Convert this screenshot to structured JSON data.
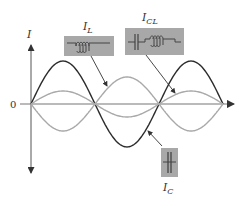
{
  "diagram": {
    "axis": {
      "y_label": "I",
      "origin_label": "0"
    },
    "labels": {
      "inductor_current": {
        "main": "I",
        "sub": "L"
      },
      "tank_current": {
        "main": "I",
        "sub": "CL"
      },
      "capacitor_current": {
        "main": "I",
        "sub": "C"
      }
    },
    "components": {
      "inductor_box": "inductor-symbol",
      "tank_box": "capacitor-inductor-symbol",
      "capacitor_box": "capacitor-symbol"
    },
    "colors": {
      "dark_curve": "#2b2b2b",
      "light_curve": "#a9a9a9",
      "axis": "#555555",
      "component_box": "#a8a8a8",
      "component_line": "#444444"
    },
    "curves": {
      "period_px": 128,
      "capacitor_amplitude": 43,
      "inductor_amplitude": 27,
      "tank_amplitude": 13
    }
  }
}
